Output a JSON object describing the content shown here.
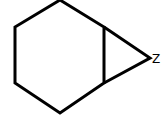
{
  "diagram": {
    "type": "chemical-structure",
    "atom_label": "Z",
    "stroke_color": "#000000",
    "background": "#ffffff"
  }
}
